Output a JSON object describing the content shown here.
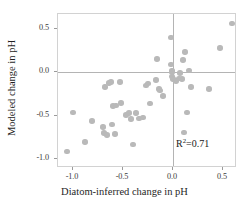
{
  "chart_data": {
    "type": "scatter",
    "title": "",
    "xlabel": "Diatom-inferred change in pH",
    "ylabel": "Modeled change in pH",
    "xlim": [
      -1.15,
      0.64
    ],
    "ylim": [
      -1.1,
      0.67
    ],
    "xticks": [
      -1.0,
      -0.5,
      0.0,
      0.5
    ],
    "xticklabels": [
      "-1.0",
      "-0.5",
      "0.0",
      "0.5"
    ],
    "yticks": [
      0.5,
      0.0,
      -0.5,
      -1.0
    ],
    "yticklabels": [
      "0.5",
      "0.0",
      "-0.5",
      "-1.0"
    ],
    "grid": false,
    "legend": null,
    "reference_lines": [
      {
        "axis": "y",
        "value": 0.0
      },
      {
        "axis": "x",
        "value": 0.0
      }
    ],
    "annotations": [
      {
        "text": "R²=0.71",
        "r2_label": "R",
        "r2_exponent": "2",
        "r2_value": "=0.71",
        "x": 0.04,
        "y": -0.82
      }
    ],
    "marker": {
      "shape": "circle",
      "color": "#b9b9b9",
      "size": 5.6
    },
    "points": [
      {
        "x": -1.06,
        "y": -0.91
      },
      {
        "x": -1.0,
        "y": -0.46
      },
      {
        "x": -0.88,
        "y": -0.8
      },
      {
        "x": -0.81,
        "y": -0.56
      },
      {
        "x": -0.7,
        "y": -0.63
      },
      {
        "x": -0.69,
        "y": -0.7
      },
      {
        "x": -0.68,
        "y": -0.17
      },
      {
        "x": -0.66,
        "y": -0.72
      },
      {
        "x": -0.64,
        "y": -0.12
      },
      {
        "x": -0.62,
        "y": -0.11
      },
      {
        "x": -0.61,
        "y": -0.6
      },
      {
        "x": -0.6,
        "y": -0.39
      },
      {
        "x": -0.58,
        "y": -0.71
      },
      {
        "x": -0.57,
        "y": -0.38
      },
      {
        "x": -0.53,
        "y": -0.11
      },
      {
        "x": -0.52,
        "y": -0.35
      },
      {
        "x": -0.47,
        "y": -0.49
      },
      {
        "x": -0.44,
        "y": -0.47
      },
      {
        "x": -0.42,
        "y": -0.54
      },
      {
        "x": -0.4,
        "y": -0.83
      },
      {
        "x": -0.37,
        "y": -0.47
      },
      {
        "x": -0.34,
        "y": -0.53
      },
      {
        "x": -0.3,
        "y": -0.52
      },
      {
        "x": -0.27,
        "y": -0.15
      },
      {
        "x": -0.25,
        "y": -0.13
      },
      {
        "x": -0.23,
        "y": -0.36
      },
      {
        "x": -0.17,
        "y": -0.09
      },
      {
        "x": -0.16,
        "y": 0.15
      },
      {
        "x": -0.14,
        "y": -0.19
      },
      {
        "x": -0.13,
        "y": -0.21
      },
      {
        "x": -0.1,
        "y": -0.27
      },
      {
        "x": -0.02,
        "y": 0.4
      },
      {
        "x": -0.02,
        "y": 0.09
      },
      {
        "x": -0.01,
        "y": 0.02
      },
      {
        "x": -0.01,
        "y": 0.0
      },
      {
        "x": -0.01,
        "y": -0.05
      },
      {
        "x": 0.0,
        "y": -0.08
      },
      {
        "x": 0.03,
        "y": -0.1
      },
      {
        "x": 0.06,
        "y": -0.07
      },
      {
        "x": 0.07,
        "y": -0.01
      },
      {
        "x": 0.09,
        "y": -0.08
      },
      {
        "x": 0.1,
        "y": 0.14
      },
      {
        "x": 0.11,
        "y": -0.69
      },
      {
        "x": 0.12,
        "y": 0.23
      },
      {
        "x": 0.14,
        "y": -0.46
      },
      {
        "x": 0.16,
        "y": 0.02
      },
      {
        "x": 0.18,
        "y": -0.17
      },
      {
        "x": 0.36,
        "y": -0.19
      },
      {
        "x": 0.47,
        "y": 0.28
      },
      {
        "x": 0.59,
        "y": 0.56
      }
    ]
  }
}
